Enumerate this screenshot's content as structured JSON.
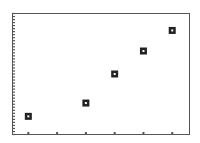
{
  "chart_data": {
    "type": "scatter",
    "title": "",
    "xlabel": "",
    "ylabel": "",
    "x": [
      1,
      3,
      4,
      5,
      6
    ],
    "values": [
      15,
      26,
      50,
      69,
      86
    ],
    "x_ticks": [
      1,
      2,
      3,
      4,
      5,
      6
    ],
    "xlim": [
      0.45,
      6.6
    ],
    "ylim": [
      0,
      100
    ],
    "y_minor_tick_count": 40,
    "grid": false,
    "legend": null,
    "marker": "square-with-white-center",
    "colors": {
      "frame": "#555555",
      "marker": "#222222",
      "background": "#ffffff"
    }
  }
}
